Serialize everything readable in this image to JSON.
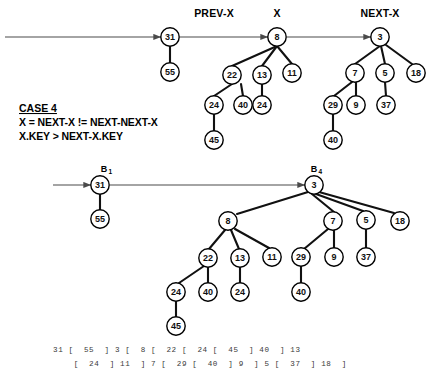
{
  "figure": {
    "background": "#ffffff",
    "ink_color": "#111111",
    "arrow_color": "#4a4a4a"
  },
  "case_box": {
    "title": "CASE 4",
    "line1": "X = NEXT-X != NEXT-NEXT-X",
    "line2": "X.KEY > NEXT-X.KEY"
  },
  "top_diagram": {
    "pointer_labels": [
      {
        "name": "prev-x",
        "text": "PREV-X",
        "x": 214,
        "y": 17
      },
      {
        "name": "x",
        "text": "X",
        "x": 277,
        "y": 17
      },
      {
        "name": "next-x",
        "text": "NEXT-X",
        "x": 380,
        "y": 17
      }
    ],
    "roots": [
      {
        "key": "31",
        "x": 170,
        "y": 37
      },
      {
        "key": "8",
        "x": 277,
        "y": 37
      },
      {
        "key": "3",
        "x": 380,
        "y": 37
      }
    ],
    "nodes": [
      {
        "key": "31",
        "x": 170,
        "y": 37
      },
      {
        "key": "55",
        "x": 170,
        "y": 72
      },
      {
        "key": "8",
        "x": 277,
        "y": 37
      },
      {
        "key": "22",
        "x": 232,
        "y": 75
      },
      {
        "key": "13",
        "x": 262,
        "y": 75
      },
      {
        "key": "11",
        "x": 292,
        "y": 73
      },
      {
        "key": "24",
        "x": 214,
        "y": 105
      },
      {
        "key": "40",
        "x": 243,
        "y": 105
      },
      {
        "key": "24",
        "x": 262,
        "y": 105
      },
      {
        "key": "45",
        "x": 214,
        "y": 140
      },
      {
        "key": "3",
        "x": 380,
        "y": 37
      },
      {
        "key": "7",
        "x": 355,
        "y": 73
      },
      {
        "key": "5",
        "x": 385,
        "y": 73
      },
      {
        "key": "18",
        "x": 416,
        "y": 73
      },
      {
        "key": "29",
        "x": 333,
        "y": 105
      },
      {
        "key": "9",
        "x": 356,
        "y": 105
      },
      {
        "key": "37",
        "x": 386,
        "y": 105
      },
      {
        "key": "40",
        "x": 333,
        "y": 140
      }
    ],
    "edges": [
      {
        "from": "31",
        "to": "55"
      },
      {
        "from": "8",
        "to": "22"
      },
      {
        "from": "8",
        "to": "13"
      },
      {
        "from": "8",
        "to": "11"
      },
      {
        "from": "22",
        "to": "24"
      },
      {
        "from": "22",
        "to": "40"
      },
      {
        "from": "13",
        "to": "24"
      },
      {
        "from": "24",
        "to": "45"
      },
      {
        "from": "3",
        "to": "7"
      },
      {
        "from": "3",
        "to": "5"
      },
      {
        "from": "3",
        "to": "18"
      },
      {
        "from": "7",
        "to": "29"
      },
      {
        "from": "7",
        "to": "9"
      },
      {
        "from": "5",
        "to": "37"
      },
      {
        "from": "29",
        "to": "40"
      }
    ],
    "list_arrows": [
      {
        "name": "arrow-into-31",
        "x1": 5,
        "y1": 37,
        "x2": 161,
        "y2": 37
      },
      {
        "name": "arrow-31-to-8",
        "x1": 180,
        "y1": 37,
        "x2": 268,
        "y2": 37
      },
      {
        "name": "arrow-8-to-3",
        "x1": 287,
        "y1": 37,
        "x2": 371,
        "y2": 37
      }
    ]
  },
  "bottom_diagram": {
    "pointer_labels": [
      {
        "name": "b1",
        "text": "B",
        "sub": "1",
        "x": 104,
        "y": 168
      },
      {
        "name": "b4",
        "text": "B",
        "sub": "4",
        "x": 314,
        "y": 168
      }
    ],
    "nodes": [
      {
        "key": "31",
        "x": 100,
        "y": 185
      },
      {
        "key": "55",
        "x": 100,
        "y": 219
      },
      {
        "key": "3",
        "x": 314,
        "y": 185
      },
      {
        "key": "8",
        "x": 228,
        "y": 221
      },
      {
        "key": "7",
        "x": 333,
        "y": 221
      },
      {
        "key": "5",
        "x": 366,
        "y": 220
      },
      {
        "key": "18",
        "x": 400,
        "y": 221
      },
      {
        "key": "22",
        "x": 208,
        "y": 258
      },
      {
        "key": "13",
        "x": 240,
        "y": 258
      },
      {
        "key": "11",
        "x": 272,
        "y": 257
      },
      {
        "key": "29",
        "x": 301,
        "y": 257
      },
      {
        "key": "9",
        "x": 334,
        "y": 257
      },
      {
        "key": "37",
        "x": 366,
        "y": 257
      },
      {
        "key": "24",
        "x": 176,
        "y": 292
      },
      {
        "key": "40",
        "x": 208,
        "y": 292
      },
      {
        "key": "24",
        "x": 240,
        "y": 292
      },
      {
        "key": "40",
        "x": 301,
        "y": 292
      },
      {
        "key": "45",
        "x": 176,
        "y": 326
      }
    ],
    "edges": [
      {
        "from": "31",
        "to": "55"
      },
      {
        "from": "3",
        "to": "8"
      },
      {
        "from": "3",
        "to": "7"
      },
      {
        "from": "3",
        "to": "5"
      },
      {
        "from": "3",
        "to": "18"
      },
      {
        "from": "8",
        "to": "22"
      },
      {
        "from": "8",
        "to": "13"
      },
      {
        "from": "8",
        "to": "11"
      },
      {
        "from": "7",
        "to": "29"
      },
      {
        "from": "7",
        "to": "9"
      },
      {
        "from": "5",
        "to": "37"
      },
      {
        "from": "22",
        "to": "24"
      },
      {
        "from": "22",
        "to": "40"
      },
      {
        "from": "13",
        "to": "24"
      },
      {
        "from": "29",
        "to": "40"
      },
      {
        "from": "24",
        "to": "45"
      }
    ],
    "list_arrows": [
      {
        "name": "arrow-into-31",
        "x1": 53,
        "y1": 185,
        "x2": 91,
        "y2": 185
      },
      {
        "name": "arrow-31-to-3",
        "x1": 110,
        "y1": 185,
        "x2": 305,
        "y2": 185
      }
    ]
  },
  "bracket_notation": {
    "line1": "31 [  55  ] 3 [  8 [  22 [  24 [  45  ] 40  ] 13",
    "line2": "    [  24  ] 11  ] 7 [  29 [  40  ] 9  ] 5 [  37  ] 18  ]"
  }
}
